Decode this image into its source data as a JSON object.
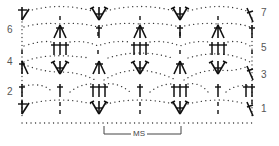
{
  "diagram": {
    "type": "crochet stitch chart",
    "colors": {
      "ink": "#111111",
      "dots": "#333333",
      "labels": "#555555"
    },
    "row_labels_left": [
      {
        "label": "6",
        "row": 6
      },
      {
        "label": "4",
        "row": 4
      },
      {
        "label": "2",
        "row": 2
      }
    ],
    "row_labels_right": [
      {
        "label": "7",
        "row": 7
      },
      {
        "label": "5",
        "row": 5
      },
      {
        "label": "3",
        "row": 3
      },
      {
        "label": "1",
        "row": 1
      }
    ],
    "repeat_bracket": {
      "label": "MS"
    },
    "symbols": [
      "V-stitch / shell (3 dc in one st)",
      "3-dc cluster (inverted V)",
      "double crochet (dagger)",
      "chain (dot)",
      "slip/half stitch (dashed vertical)"
    ]
  }
}
